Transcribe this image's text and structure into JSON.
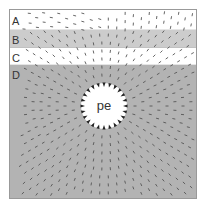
{
  "diagram": {
    "title": "",
    "bands": [
      {
        "id": "A",
        "label": "A",
        "fill": "#ffffff"
      },
      {
        "id": "B",
        "label": "B",
        "fill": "#cccccc"
      },
      {
        "id": "C",
        "label": "C",
        "fill": "#ffffff"
      },
      {
        "id": "D",
        "label": "D",
        "fill": "#b3b3b3"
      }
    ],
    "center": {
      "label": "pe",
      "fill": "#ffffff"
    },
    "colors": {
      "frame": "#999999",
      "dash": "#555555",
      "arrow": "#222222"
    }
  }
}
